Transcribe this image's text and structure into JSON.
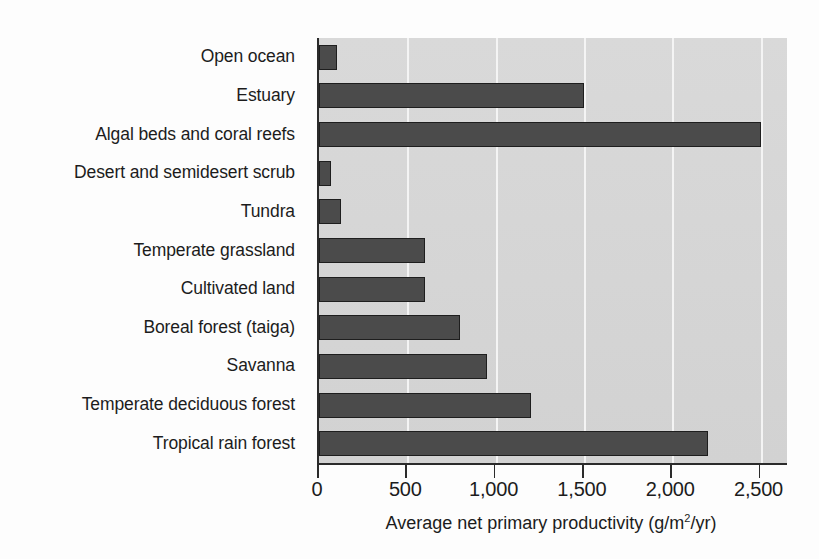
{
  "chart_data": {
    "type": "bar",
    "orientation": "horizontal",
    "title": "",
    "xlabel": "Average net primary productivity (g/m2/yr)",
    "xlabel_prefix": "Average net primary productivity (g/m",
    "xlabel_exponent": "2",
    "xlabel_suffix": "/yr)",
    "ylabel": "",
    "xlim": [
      0,
      2650
    ],
    "xticks": [
      0,
      500,
      1000,
      1500,
      2000,
      2500
    ],
    "xtick_labels": [
      "0",
      "500",
      "1,000",
      "1,500",
      "2,000",
      "2,500"
    ],
    "grid": true,
    "grid_axis": "x",
    "legend": false,
    "categories": [
      "Open ocean",
      "Estuary",
      "Algal beds and coral reefs",
      "Desert and semidesert scrub",
      "Tundra",
      "Temperate grassland",
      "Cultivated land",
      "Boreal forest (taiga)",
      "Savanna",
      "Temperate deciduous forest",
      "Tropical rain forest"
    ],
    "values": [
      100,
      1500,
      2500,
      70,
      125,
      600,
      600,
      800,
      950,
      1200,
      2200
    ],
    "bar_color": "#4b4b4b",
    "bar_edge_color": "#1e1e1e",
    "plot_background": "#d5d5d5",
    "gridline_color": "#f4f4f4",
    "axis_color": "#2b2b2b",
    "text_color": "#1c1c1c"
  }
}
